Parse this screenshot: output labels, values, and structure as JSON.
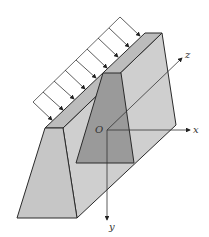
{
  "diagram": {
    "title": "",
    "labels": {
      "origin": "O",
      "x_axis": "x",
      "y_axis": "y",
      "z_axis": "z"
    },
    "colors": {
      "front_face": "#c6c6c6",
      "top_face": "#bcbcbc",
      "side_face": "#cfcfcf",
      "section": "#9a9a9a",
      "edge": "#2a2a2a",
      "load": "#333333"
    },
    "load_arrow_count": 9
  }
}
